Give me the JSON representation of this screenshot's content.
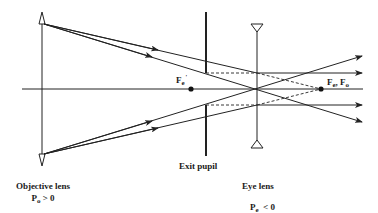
{
  "diagram": {
    "type": "optical ray diagram (Galilean telescope)",
    "colors": {
      "line": "#222222",
      "background": "#ffffff"
    },
    "optical_axis": {
      "x1": 22,
      "x2": 363,
      "y": 89
    },
    "components": [
      {
        "id": "objective-lens",
        "kind": "converging lens",
        "x": 42,
        "y_top": 12,
        "y_bottom": 166
      },
      {
        "id": "exit-pupil",
        "kind": "aperture stop",
        "x": 206,
        "upper": [
          12,
          73
        ],
        "lower": [
          105,
          156
        ]
      },
      {
        "id": "eye-lens",
        "kind": "diverging lens",
        "x": 257,
        "y_top": 24,
        "y_bottom": 148
      }
    ],
    "focal_points": [
      {
        "id": "fe-prime",
        "x": 191,
        "y": 89
      },
      {
        "id": "fe-fo",
        "x": 321,
        "y": 89
      }
    ]
  },
  "labels": {
    "objective": {
      "title": "Objective lens",
      "power_symbol": "P",
      "power_sub": "o",
      "power_relation": " > 0"
    },
    "exit_pupil": {
      "title": "Exit pupil"
    },
    "eye": {
      "title": "Eye lens",
      "power_symbol": "P",
      "power_sub": "e",
      "power_relation": "  < 0"
    },
    "fe_prime": {
      "symbol": "F",
      "sub": "e",
      "sup": "'"
    },
    "fe_fo": {
      "symbol1": "F",
      "sub1": "e",
      "sep": ", ",
      "symbol2": "F",
      "sub2": "o"
    }
  }
}
